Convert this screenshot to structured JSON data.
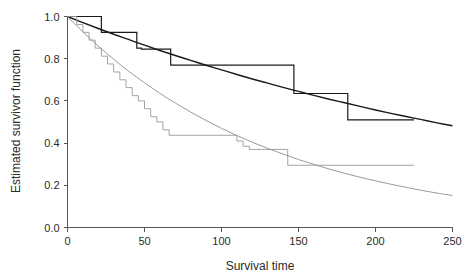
{
  "chart_data": {
    "type": "line",
    "title": "",
    "xlabel": "Survival time",
    "ylabel": "Estimated survivor function",
    "xlim": [
      0,
      250
    ],
    "ylim": [
      0.0,
      1.0
    ],
    "grid": false,
    "legend": "none",
    "xticks": [
      "0",
      "50",
      "100",
      "150",
      "200",
      "250"
    ],
    "xtick_values": [
      0,
      50,
      100,
      150,
      200,
      250
    ],
    "yticks": [
      "0.0",
      "0.2",
      "0.4",
      "0.6",
      "0.8",
      "1.0"
    ],
    "ytick_values": [
      0.0,
      0.2,
      0.4,
      0.6,
      0.8,
      1.0
    ],
    "series": [
      {
        "name": "Kaplan-Meier step (upper group)",
        "style": "step",
        "color": "#1a1a1a",
        "width": 1.2,
        "x": [
          0,
          22,
          22,
          45,
          45,
          48,
          48,
          67,
          67,
          69,
          69,
          147,
          147,
          182,
          182,
          225
        ],
        "y": [
          1.0,
          1.0,
          0.925,
          0.925,
          0.85,
          0.85,
          0.845,
          0.845,
          0.77,
          0.77,
          0.77,
          0.77,
          0.635,
          0.635,
          0.51,
          0.51
        ]
      },
      {
        "name": "Fitted exponential/Weibull (upper group)",
        "style": "smooth",
        "color": "#1a1a1a",
        "width": 1.4,
        "x": [
          0,
          10,
          20,
          30,
          40,
          50,
          60,
          70,
          80,
          90,
          100,
          110,
          120,
          130,
          140,
          150,
          160,
          170,
          180,
          190,
          200,
          210,
          220,
          230,
          240,
          250
        ],
        "y": [
          1.0,
          0.971,
          0.943,
          0.916,
          0.89,
          0.864,
          0.839,
          0.815,
          0.792,
          0.769,
          0.747,
          0.725,
          0.704,
          0.684,
          0.664,
          0.645,
          0.626,
          0.608,
          0.591,
          0.574,
          0.557,
          0.541,
          0.526,
          0.511,
          0.496,
          0.482
        ]
      },
      {
        "name": "Kaplan-Meier step (lower group)",
        "style": "step",
        "color": "#9a9a9a",
        "width": 0.9,
        "x": [
          0,
          6,
          6,
          10,
          10,
          14,
          14,
          18,
          18,
          22,
          22,
          26,
          26,
          30,
          30,
          34,
          34,
          38,
          38,
          42,
          42,
          46,
          46,
          50,
          50,
          54,
          54,
          58,
          58,
          62,
          62,
          66,
          66,
          70,
          70,
          110,
          110,
          114,
          114,
          118,
          118,
          122,
          122,
          143,
          143,
          225
        ],
        "y": [
          1.0,
          1.0,
          0.962,
          0.962,
          0.925,
          0.925,
          0.888,
          0.888,
          0.85,
          0.85,
          0.812,
          0.812,
          0.775,
          0.775,
          0.737,
          0.737,
          0.7,
          0.7,
          0.663,
          0.663,
          0.625,
          0.625,
          0.6,
          0.6,
          0.563,
          0.563,
          0.525,
          0.525,
          0.5,
          0.5,
          0.463,
          0.463,
          0.437,
          0.437,
          0.437,
          0.437,
          0.41,
          0.41,
          0.385,
          0.385,
          0.37,
          0.37,
          0.37,
          0.37,
          0.295,
          0.295
        ]
      },
      {
        "name": "Fitted exponential/Weibull (lower group)",
        "style": "smooth",
        "color": "#9a9a9a",
        "width": 1.0,
        "x": [
          0,
          10,
          20,
          30,
          40,
          50,
          60,
          70,
          80,
          90,
          100,
          110,
          120,
          130,
          140,
          150,
          160,
          170,
          180,
          190,
          200,
          210,
          220,
          230,
          240,
          250
        ],
        "y": [
          1.0,
          0.927,
          0.86,
          0.797,
          0.739,
          0.686,
          0.636,
          0.59,
          0.547,
          0.507,
          0.47,
          0.436,
          0.404,
          0.375,
          0.348,
          0.322,
          0.299,
          0.277,
          0.257,
          0.238,
          0.221,
          0.205,
          0.19,
          0.176,
          0.163,
          0.152
        ]
      }
    ]
  },
  "axes": {
    "x_label": "Survival time",
    "y_label": "Estimated survivor function"
  }
}
